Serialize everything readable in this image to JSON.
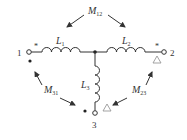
{
  "diagram": {
    "title": "",
    "type": "coupled-inductors",
    "terminals": [
      {
        "id": "1",
        "label": "1"
      },
      {
        "id": "2",
        "label": "2"
      },
      {
        "id": "3",
        "label": "3"
      }
    ],
    "inductors": [
      {
        "id": "L1",
        "label": "L",
        "sub": "1"
      },
      {
        "id": "L2",
        "label": "L",
        "sub": "2"
      },
      {
        "id": "L3",
        "label": "L",
        "sub": "3"
      }
    ],
    "mutuals": [
      {
        "id": "M12",
        "label": "M",
        "sub": "12"
      },
      {
        "id": "M31",
        "label": "M",
        "sub": "31"
      },
      {
        "id": "M23",
        "label": "M",
        "sub": "23"
      }
    ],
    "polarity_marks": {
      "star": "*",
      "dot": "•",
      "triangle": "△"
    },
    "colors": {
      "stroke": "#333333",
      "triangle": "#999999",
      "background": "#ffffff"
    }
  }
}
